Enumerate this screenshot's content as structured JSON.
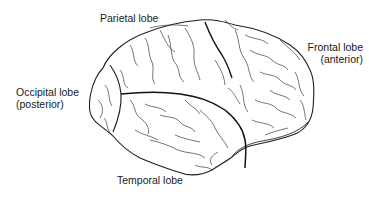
{
  "diagram": {
    "labels": {
      "parietal": "Parietal lobe",
      "frontal_line1": "Frontal lobe",
      "frontal_line2": "(anterior)",
      "occipital_line1": "Occipital lobe",
      "occipital_line2": "(posterior)",
      "temporal": "Temporal lobe"
    },
    "colors": {
      "outline": "#1f1f1f",
      "sulci": "#3a3a3a",
      "major_fissure": "#111111",
      "background": "#ffffff"
    }
  }
}
